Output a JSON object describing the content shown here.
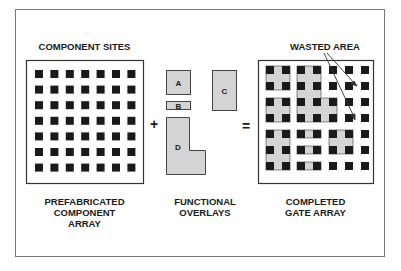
{
  "figure": {
    "labels": {
      "component_sites": "COMPONENT SITES",
      "wasted_area": "WASTED AREA",
      "prefab_line1": "PREFABRICATED",
      "prefab_line2": "COMPONENT",
      "prefab_line3": "ARRAY",
      "overlays_line1": "FUNCTIONAL",
      "overlays_line2": "OVERLAYS",
      "completed_line1": "COMPLETED",
      "completed_line2": "GATE ARRAY"
    },
    "operators": {
      "plus": "+",
      "equals": "="
    },
    "overlays": [
      {
        "id": "A",
        "label": "A"
      },
      {
        "id": "B",
        "label": "B"
      },
      {
        "id": "C",
        "label": "C"
      },
      {
        "id": "D",
        "label": "D"
      }
    ],
    "component_grid": {
      "rows": 7,
      "cols": 7
    },
    "colors": {
      "frame": "#555555",
      "site": "#1a1a1a",
      "overlay_fill": "#d4d4d4",
      "overlay_stroke": "#444444",
      "text": "#1a1a1a"
    }
  }
}
